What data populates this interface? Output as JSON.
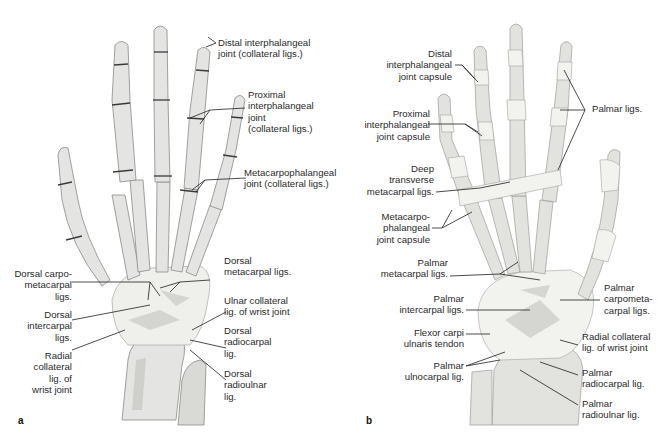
{
  "figure": {
    "panels": [
      {
        "id": "a",
        "letter": "a",
        "view": "dorsal",
        "labels": {
          "distal_ip": "Distal interphalangeal\njoint (collateral ligs.)",
          "proximal_ip": "Proximal\ninterphalangeal\njoint\n(collateral ligs.)",
          "mcp": "Metacarpophalangeal\njoint (collateral ligs.)",
          "dorsal_cmc": "Dorsal carpo-\nmetacarpal\nligs.",
          "dorsal_metacarpal": "Dorsal\nmetacarpal ligs.",
          "dorsal_intercarpal": "Dorsal\nintercarpal\nligs.",
          "ulnar_collateral": "Ulnar collateral\nlig. of wrist joint",
          "dorsal_radiocarpal": "Dorsal\nradiocarpal\nlig.",
          "radial_collateral": "Radial\ncollateral\nlig. of\nwrist joint",
          "dorsal_radioulnar": "Dorsal\nradioulnar\nlig."
        }
      },
      {
        "id": "b",
        "letter": "b",
        "view": "palmar",
        "labels": {
          "distal_ip_capsule": "Distal\ninterphalangeal\njoint capsule",
          "palmar_ligs": "Palmar ligs.",
          "proximal_ip_capsule": "Proximal\ninterphalangeal\njoint capsule",
          "deep_transverse": "Deep\ntransverse\nmetacarpal ligs.",
          "mcp_capsule": "Metacarpo-\nphalangeal\njoint capsule",
          "palmar_metacarpal": "Palmar\nmetacarpal ligs.",
          "palmar_cmc": "Palmar\ncarpometa-\ncarpal ligs.",
          "palmar_intercarpal": "Palmar\nintercarpal ligs.",
          "radial_collateral": "Radial collateral\nlig. of wrist joint",
          "fcu_tendon": "Flexor carpi\nulnaris tendon",
          "palmar_ulnocarpal": "Palmar\nulnocarpal lig.",
          "palmar_radiocarpal": "Palmar\nradiocarpal lig.",
          "palmar_radioulnar": "Palmar\nradioulnar lig."
        }
      }
    ]
  }
}
